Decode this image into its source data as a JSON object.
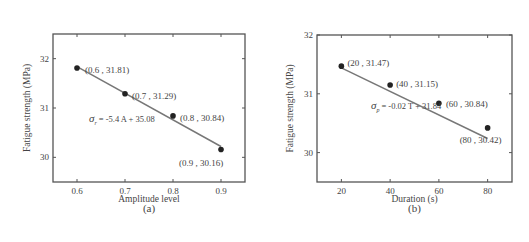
{
  "chart_data": [
    {
      "type": "scatter",
      "panel_label": "(a)",
      "title": "",
      "xlabel": "Amplitude level",
      "ylabel": "Fatigue strength (MPa)",
      "x": [
        0.6,
        0.7,
        0.8,
        0.9
      ],
      "y": [
        31.81,
        31.29,
        30.84,
        30.16
      ],
      "point_labels": [
        "(0.6 , 31.81)",
        "(0.7 , 31.29)",
        "(0.8 , 30.84)",
        "(0.9 , 30.16)"
      ],
      "fit": {
        "equation": "σ_r = -5.4 A + 35.08",
        "symbol": "σ",
        "subscript": "r",
        "rhs": "= -5.4 A + 35.08",
        "slope": -5.4,
        "intercept": 35.08
      },
      "xticks": [
        0.6,
        0.7,
        0.8,
        0.9
      ],
      "xtick_labels": [
        "0.6",
        "0.7",
        "0.8",
        "0.9"
      ],
      "yticks": [
        30,
        31,
        32
      ],
      "ytick_labels": [
        "30",
        "31",
        "32"
      ],
      "xlim": [
        0.55,
        0.95
      ],
      "ylim": [
        29.5,
        32.5
      ],
      "grid": false,
      "legend": null
    },
    {
      "type": "scatter",
      "panel_label": "(b)",
      "title": "",
      "xlabel": "Duration (s)",
      "ylabel": "Fatigue strength (MPa)",
      "x": [
        20,
        40,
        60,
        80
      ],
      "y": [
        31.47,
        31.15,
        30.84,
        30.42
      ],
      "point_labels": [
        "(20 , 31.47)",
        "(40 , 31.15)",
        "(60 , 30.84)",
        "(80 , 30.42)"
      ],
      "fit": {
        "equation": "σ_p = -0.02 T + 31.84",
        "symbol": "σ",
        "subscript": "p",
        "rhs": "= -0.02 T + 31.84",
        "slope": -0.02,
        "intercept": 31.84
      },
      "xticks": [
        20,
        40,
        60,
        80
      ],
      "xtick_labels": [
        "20",
        "40",
        "60",
        "80"
      ],
      "yticks": [
        30,
        31,
        32
      ],
      "ytick_labels": [
        "30",
        "31",
        "32"
      ],
      "xlim": [
        10,
        90
      ],
      "ylim": [
        29.5,
        32
      ],
      "grid": false,
      "legend": null
    }
  ]
}
